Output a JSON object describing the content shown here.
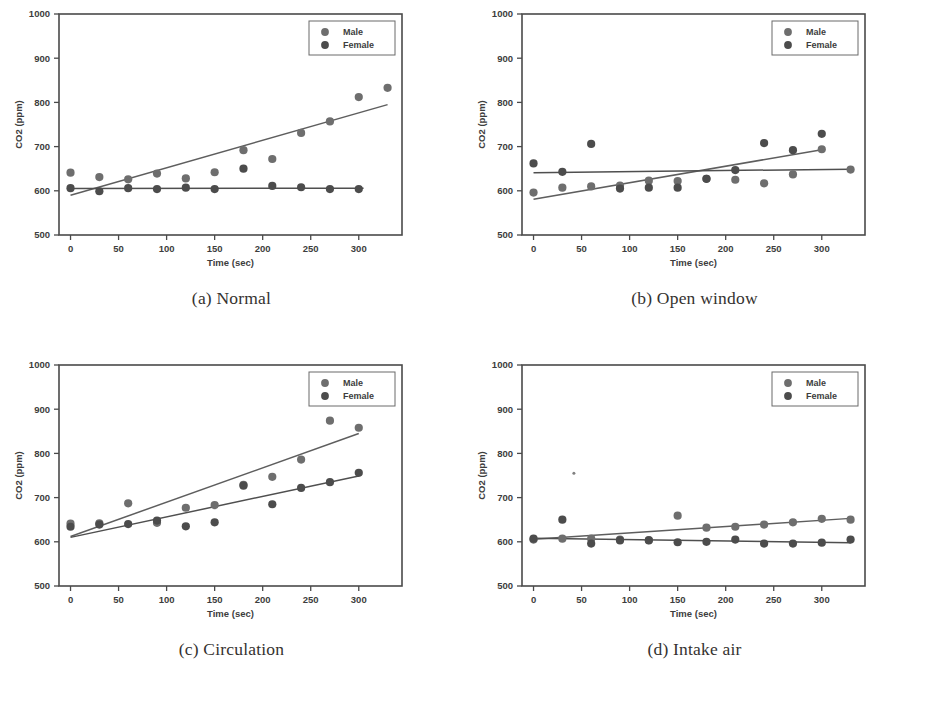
{
  "figure": {
    "panels": [
      {
        "caption": "(a) Normal",
        "key": "normal"
      },
      {
        "caption": "(b) Open window",
        "key": "open_window"
      },
      {
        "caption": "(c) Circulation",
        "key": "circulation"
      },
      {
        "caption": "(d) Intake air",
        "key": "intake_air"
      }
    ]
  },
  "axis": {
    "xlabel": "Time (sec)",
    "ylabel": "CO2  (ppm)",
    "xticks": [
      "0",
      "50",
      "100",
      "150",
      "200",
      "250",
      "300"
    ],
    "yticks": [
      "500",
      "600",
      "700",
      "800",
      "900",
      "1000"
    ]
  },
  "legend": {
    "male": "Male",
    "female": "Female"
  },
  "colors": {
    "male_marker": "#6e6e6e",
    "female_marker": "#4c4c4c",
    "fit_line": "#5e5e5e",
    "axis": "#4a4a4a",
    "text": "#3d3d3d",
    "caption": "#35322f",
    "background": "#ffffff"
  },
  "chart_data": [
    {
      "type": "scatter",
      "panel": "a",
      "title": "(a) Normal",
      "xlabel": "Time (sec)",
      "ylabel": "CO2  (ppm)",
      "xlim": [
        -12,
        345
      ],
      "ylim": [
        500,
        1000
      ],
      "xticks": [
        0,
        50,
        100,
        150,
        200,
        250,
        300
      ],
      "yticks": [
        500,
        600,
        700,
        800,
        900,
        1000
      ],
      "grid": false,
      "legend_position": "top-right",
      "series": [
        {
          "name": "Male",
          "x": [
            0,
            30,
            60,
            90,
            120,
            150,
            180,
            210,
            240,
            270,
            300
          ],
          "y": [
            641,
            631,
            626,
            639,
            628,
            642,
            692,
            672,
            731,
            757,
            812
          ],
          "extra_points": [
            [
              330,
              833
            ]
          ],
          "fit": {
            "x1": 0,
            "y1": 590,
            "x2": 330,
            "y2": 795
          }
        },
        {
          "name": "Female",
          "x": [
            0,
            30,
            60,
            90,
            120,
            150,
            180,
            210,
            240,
            270,
            300
          ],
          "y": [
            606,
            599,
            606,
            604,
            607,
            604,
            650,
            611,
            608,
            604,
            604
          ],
          "extra_points": [],
          "fit": {
            "x1": 0,
            "y1": 605,
            "x2": 305,
            "y2": 606
          }
        }
      ]
    },
    {
      "type": "scatter",
      "panel": "b",
      "title": "(b) Open window",
      "xlabel": "Time (sec)",
      "ylabel": "CO2  (ppm)",
      "xlim": [
        -12,
        345
      ],
      "ylim": [
        500,
        1000
      ],
      "xticks": [
        0,
        50,
        100,
        150,
        200,
        250,
        300
      ],
      "yticks": [
        500,
        600,
        700,
        800,
        900,
        1000
      ],
      "grid": false,
      "legend_position": "top-right",
      "series": [
        {
          "name": "Male",
          "x": [
            0,
            30,
            60,
            90,
            120,
            150,
            180,
            210,
            240,
            270,
            300
          ],
          "y": [
            596,
            607,
            610,
            612,
            623,
            622,
            627,
            625,
            617,
            637,
            694
          ],
          "extra_points": [
            [
              330,
              648
            ]
          ],
          "fit": {
            "x1": 0,
            "y1": 581,
            "x2": 300,
            "y2": 693
          }
        },
        {
          "name": "Female",
          "x": [
            0,
            30,
            60,
            90,
            120,
            150,
            180,
            210,
            240,
            270,
            300
          ],
          "y": [
            662,
            643,
            706,
            605,
            607,
            607,
            627,
            647,
            708,
            692,
            729
          ],
          "extra_points": [],
          "fit": {
            "x1": 0,
            "y1": 641,
            "x2": 330,
            "y2": 649
          }
        }
      ]
    },
    {
      "type": "scatter",
      "panel": "c",
      "title": "(c) Circulation",
      "xlabel": "Time (sec)",
      "ylabel": "CO2  (ppm)",
      "xlim": [
        -12,
        345
      ],
      "ylim": [
        500,
        1000
      ],
      "xticks": [
        0,
        50,
        100,
        150,
        200,
        250,
        300
      ],
      "yticks": [
        500,
        600,
        700,
        800,
        900,
        1000
      ],
      "grid": false,
      "legend_position": "top-right",
      "series": [
        {
          "name": "Male",
          "x": [
            0,
            30,
            60,
            90,
            120,
            150,
            180,
            210,
            240,
            270,
            300
          ],
          "y": [
            641,
            642,
            687,
            643,
            677,
            683,
            729,
            747,
            786,
            874,
            858
          ],
          "extra_points": [],
          "fit": {
            "x1": 0,
            "y1": 612,
            "x2": 300,
            "y2": 845
          }
        },
        {
          "name": "Female",
          "x": [
            0,
            30,
            60,
            90,
            120,
            150,
            180,
            210,
            240,
            270,
            300
          ],
          "y": [
            634,
            639,
            640,
            648,
            635,
            644,
            727,
            685,
            722,
            735,
            756
          ],
          "extra_points": [],
          "fit": {
            "x1": 0,
            "y1": 610,
            "x2": 300,
            "y2": 749
          }
        }
      ]
    },
    {
      "type": "scatter",
      "panel": "d",
      "title": "(d) Intake air",
      "xlabel": "Time (sec)",
      "ylabel": "CO2  (ppm)",
      "xlim": [
        -12,
        345
      ],
      "ylim": [
        500,
        1000
      ],
      "xticks": [
        0,
        50,
        100,
        150,
        200,
        250,
        300
      ],
      "yticks": [
        500,
        600,
        700,
        800,
        900,
        1000
      ],
      "grid": false,
      "legend_position": "top-right",
      "series": [
        {
          "name": "Male",
          "x": [
            0,
            30,
            60,
            90,
            120,
            150,
            180,
            210,
            240,
            270,
            300
          ],
          "y": [
            605,
            607,
            607,
            605,
            604,
            659,
            632,
            634,
            639,
            644,
            652
          ],
          "extra_points": [
            [
              330,
              650
            ]
          ],
          "fit": {
            "x1": 0,
            "y1": 606,
            "x2": 330,
            "y2": 653
          }
        },
        {
          "name": "Female",
          "x": [
            0,
            30,
            60,
            90,
            120,
            150,
            180,
            210,
            240,
            270,
            300
          ],
          "y": [
            607,
            650,
            596,
            603,
            603,
            599,
            600,
            605,
            596,
            596,
            598
          ],
          "extra_points": [
            [
              330,
              605
            ],
            [
              42,
              755
            ]
          ],
          "fit": {
            "x1": 0,
            "y1": 608,
            "x2": 330,
            "y2": 598
          }
        }
      ]
    }
  ]
}
